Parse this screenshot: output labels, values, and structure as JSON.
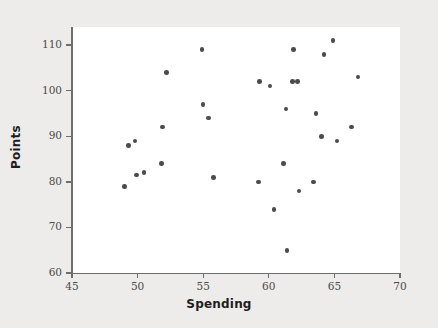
{
  "chart_data": {
    "type": "scatter",
    "title": "",
    "xlabel": "Spending",
    "ylabel": "Points",
    "xlim": [
      45,
      70
    ],
    "ylim": [
      60,
      115
    ],
    "grid": false,
    "legend": null,
    "xticks": [
      45,
      50,
      55,
      60,
      65,
      70
    ],
    "yticks": [
      60,
      70,
      80,
      90,
      100,
      110
    ],
    "xticklabels": [
      "45",
      "50",
      "55",
      "60",
      "65",
      "70"
    ],
    "yticklabels": [
      "60",
      "70",
      "80",
      "90",
      "100",
      "110"
    ],
    "marker_color": "#4b4b4e",
    "axis_color": "#6d6d6d",
    "plot_background": "#ffffff",
    "figure_background": "#edeceb",
    "points": [
      {
        "x": 49.0,
        "y": 79
      },
      {
        "x": 49.3,
        "y": 88
      },
      {
        "x": 49.8,
        "y": 89
      },
      {
        "x": 49.9,
        "y": 81.5
      },
      {
        "x": 50.5,
        "y": 82
      },
      {
        "x": 51.8,
        "y": 84
      },
      {
        "x": 51.9,
        "y": 92
      },
      {
        "x": 52.2,
        "y": 104
      },
      {
        "x": 54.9,
        "y": 109
      },
      {
        "x": 55.0,
        "y": 97
      },
      {
        "x": 55.4,
        "y": 94
      },
      {
        "x": 55.8,
        "y": 81
      },
      {
        "x": 59.2,
        "y": 80
      },
      {
        "x": 59.3,
        "y": 102
      },
      {
        "x": 60.1,
        "y": 101
      },
      {
        "x": 60.4,
        "y": 74
      },
      {
        "x": 61.1,
        "y": 84
      },
      {
        "x": 61.3,
        "y": 96
      },
      {
        "x": 61.4,
        "y": 65
      },
      {
        "x": 61.8,
        "y": 102
      },
      {
        "x": 61.9,
        "y": 109
      },
      {
        "x": 62.2,
        "y": 102
      },
      {
        "x": 62.3,
        "y": 78
      },
      {
        "x": 63.4,
        "y": 80
      },
      {
        "x": 63.6,
        "y": 95
      },
      {
        "x": 64.0,
        "y": 90
      },
      {
        "x": 64.2,
        "y": 108
      },
      {
        "x": 64.9,
        "y": 111
      },
      {
        "x": 65.2,
        "y": 89
      },
      {
        "x": 66.3,
        "y": 92
      },
      {
        "x": 66.8,
        "y": 103
      }
    ]
  }
}
